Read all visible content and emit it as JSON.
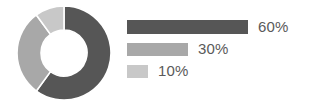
{
  "chart_data": {
    "type": "pie",
    "variant": "donut",
    "title": "",
    "subtitle": "",
    "xlabel": "",
    "ylabel": "",
    "categories": [
      "60%",
      "30%",
      "10%"
    ],
    "values": [
      60,
      30,
      10
    ],
    "value_unit": "percent",
    "data_labels": [
      "60%",
      "30%",
      "10%"
    ],
    "slice_colors": [
      "#565656",
      "#a8a8a8",
      "#c8c8c8"
    ],
    "slice_start_angles_deg": [
      0,
      216,
      324
    ],
    "slice_sweep_angles_deg": [
      216,
      108,
      36
    ],
    "start_angle_deg": 0,
    "direction": "clockwise",
    "inner_radius_ratio": 0.49,
    "slice_gap": true,
    "gap_color": "#ffffff",
    "grid": false,
    "legend": "right",
    "legend_style": "proportional-bars",
    "legend_entries": [
      {
        "label": "60%",
        "value": 60,
        "color": "#565656",
        "bar_width_px": 121
      },
      {
        "label": "30%",
        "value": 30,
        "color": "#a8a8a8",
        "bar_width_px": 61
      },
      {
        "label": "10%",
        "value": 10,
        "color": "#c8c8c8",
        "bar_width_px": 21
      }
    ],
    "background_color": "#ffffff",
    "label_color": "#5a5a5a"
  },
  "donut": {
    "center_x": 47,
    "center_y": 47,
    "outer_radius": 47,
    "inner_radius": 23,
    "gap_stroke_px": 1.6
  }
}
